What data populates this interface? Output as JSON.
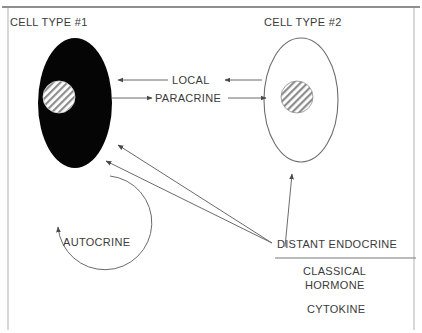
{
  "figure": {
    "cells": [
      {
        "title": "CELL TYPE #1",
        "fill": "#050505",
        "nucleus": "hatched"
      },
      {
        "title": "CELL TYPE #2",
        "fill": "#ffffff",
        "nucleus": "hatched"
      }
    ],
    "signal_labels": {
      "local": "LOCAL",
      "paracrine": "PARACRINE",
      "autocrine": "AUTOCRINE",
      "distant_endocrine": "DISTANT ENDOCRINE"
    },
    "endocrine_types": [
      "CLASSICAL",
      "HORMONE",
      "CYTOKINE"
    ],
    "colors": {
      "stroke": "#6b6b6b",
      "text": "#3b3b3b",
      "cell_fill_dark": "#050505",
      "background": "#ffffff",
      "frame": "#9a9a9a"
    }
  }
}
